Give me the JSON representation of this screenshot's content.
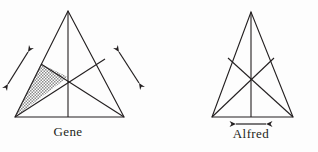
{
  "figure": {
    "background_color": "#fdfdfd",
    "stroke_color": "#231f20",
    "shade_fill_color": "#b0b0b0",
    "panels": [
      {
        "id": "gene",
        "label": "Gene",
        "label_x": 68,
        "label_y": 136,
        "triangle": {
          "apex": [
            68,
            11
          ],
          "base_left": [
            15,
            117
          ],
          "base_right": [
            124,
            117
          ]
        },
        "interior_point": [
          68,
          77
        ],
        "cevians": [
          {
            "name": "apex-to-base-midpoint",
            "from": [
              68,
              11
            ],
            "to": [
              68,
              117
            ]
          },
          {
            "name": "base-left-to-right-edge",
            "from": [
              15,
              117
            ],
            "to": [
              105,
              59
            ]
          },
          {
            "name": "base-right-to-left-edge",
            "from": [
              124,
              117
            ],
            "to": [
              41,
              64
            ]
          }
        ],
        "shaded_region": {
          "name": "shaded-cevian-triangle",
          "points": [
            [
              15,
              117
            ],
            [
              41,
              64
            ],
            [
              68,
              77
            ]
          ],
          "pattern": "stipple"
        },
        "arrows": [
          {
            "name": "left-diagonal-arrow",
            "orientation": "diagonal-up-right",
            "from": [
              8,
              84
            ],
            "to": [
              28,
              52
            ],
            "double_headed": true
          },
          {
            "name": "right-diagonal-arrow",
            "orientation": "diagonal-up-left",
            "from": [
              139,
              83
            ],
            "to": [
              119,
              52
            ],
            "double_headed": true
          }
        ]
      },
      {
        "id": "alfred",
        "label": "Alfred",
        "label_x": 251,
        "label_y": 138,
        "triangle": {
          "apex": [
            251,
            12
          ],
          "base_left": [
            212,
            117
          ],
          "base_right": [
            293,
            117
          ]
        },
        "interior_point": [
          251,
          78
        ],
        "cevians": [
          {
            "name": "apex-to-base-midpoint",
            "from": [
              251,
              12
            ],
            "to": [
              251,
              117
            ]
          },
          {
            "name": "base-left-to-right-edge",
            "from": [
              212,
              117
            ],
            "to": [
              274,
              58
            ]
          },
          {
            "name": "base-right-to-left-edge",
            "from": [
              293,
              117
            ],
            "to": [
              228,
              58
            ]
          }
        ],
        "shaded_region": null,
        "arrows": [
          {
            "name": "horizontal-arrow",
            "orientation": "horizontal",
            "from": [
              236,
              124
            ],
            "to": [
              266,
              124
            ],
            "double_headed": true
          }
        ]
      }
    ]
  }
}
